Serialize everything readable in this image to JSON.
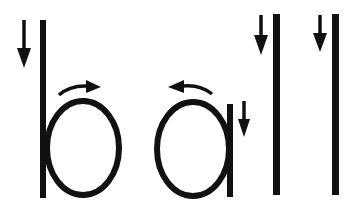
{
  "word": "ball",
  "letters": [
    {
      "char": "b",
      "strokes": [
        "down",
        "clockwise"
      ]
    },
    {
      "char": "a",
      "strokes": [
        "counter-clockwise",
        "down"
      ]
    },
    {
      "char": "l",
      "strokes": [
        "down"
      ]
    },
    {
      "char": "l",
      "strokes": [
        "down"
      ]
    }
  ],
  "colors": {
    "ink": "#111111",
    "background": "#ffffff"
  }
}
